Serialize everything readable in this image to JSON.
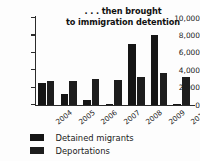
{
  "chart_data": {
    "type": "bar",
    "title": ". . . then brought\nto immigration detention",
    "xlabel": "",
    "ylabel": "",
    "categories": [
      "2004",
      "2005",
      "2006",
      "2007",
      "2008",
      "2009",
      "2010"
    ],
    "series": [
      {
        "name": "Detained migrants",
        "color": "#151515",
        "values": [
          2500,
          1300,
          600,
          0,
          7000,
          8000,
          0
        ]
      },
      {
        "name": "Deportations",
        "color": "#1d1d1d",
        "values": [
          2750,
          2800,
          2950,
          2850,
          3200,
          3650,
          3250
        ]
      }
    ],
    "ylim": [
      0,
      10000
    ],
    "ytick_values": [
      0,
      2000,
      4000,
      6000,
      8000,
      10000
    ],
    "ytick_labels": [
      "0",
      "2,000",
      "4,000",
      "6,000",
      "8,000",
      "10,000"
    ],
    "grid": false,
    "legend_position": "bottom-left"
  }
}
